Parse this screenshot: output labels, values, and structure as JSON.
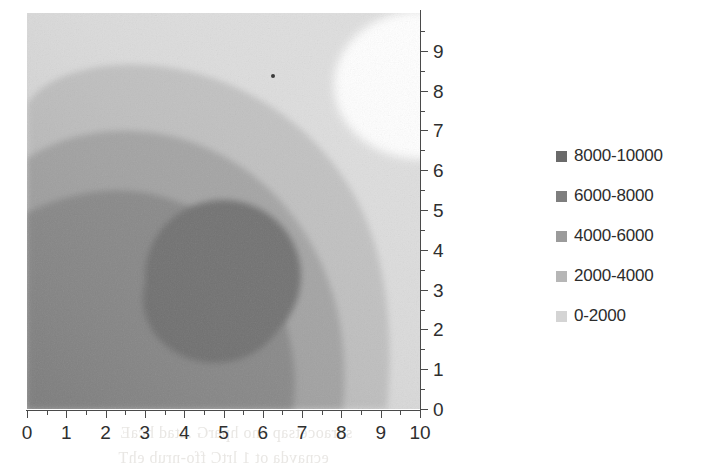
{
  "chart_data": {
    "type": "heatmap",
    "title": "",
    "xlabel": "",
    "ylabel": "",
    "xlim": [
      0,
      10
    ],
    "ylim": [
      0,
      10
    ],
    "grid": false,
    "legend_position": "right",
    "x_ticks": [
      "0",
      "1",
      "2",
      "3",
      "4",
      "5",
      "6",
      "7",
      "8",
      "9",
      "10"
    ],
    "y_ticks": [
      "0",
      "1",
      "2",
      "3",
      "4",
      "5",
      "6",
      "7",
      "8",
      "9"
    ],
    "minor_tick_step": 0.5,
    "colorscale": "grayscale-inverted",
    "value_range": [
      0,
      10000
    ],
    "band_step": 2000,
    "peak": {
      "x": 6.0,
      "y": 3.3,
      "value": 10000
    },
    "minimum": {
      "x": 9.6,
      "y": 8.9,
      "value": 0
    },
    "bands": [
      {
        "label": "8000-10000",
        "min": 8000,
        "max": 10000,
        "color": "#6f6f6f"
      },
      {
        "label": "6000-8000",
        "min": 6000,
        "max": 8000,
        "color": "#8a8a8a"
      },
      {
        "label": "4000-6000",
        "min": 4000,
        "max": 6000,
        "color": "#a5a5a5"
      },
      {
        "label": "2000-4000",
        "min": 2000,
        "max": 4000,
        "color": "#c2c2c2"
      },
      {
        "label": "0-2000",
        "min": 0,
        "max": 2000,
        "color": "#dedede"
      }
    ],
    "series": [
      {
        "name": "8000-10000",
        "values": [
          8000,
          10000
        ]
      },
      {
        "name": "6000-8000",
        "values": [
          6000,
          8000
        ]
      },
      {
        "name": "4000-6000",
        "values": [
          4000,
          6000
        ]
      },
      {
        "name": "2000-4000",
        "values": [
          2000,
          4000
        ]
      },
      {
        "name": "0-2000",
        "values": [
          0,
          2000
        ]
      }
    ]
  },
  "legend": {
    "items": [
      {
        "label": "8000-10000",
        "color": "#6a6a6a"
      },
      {
        "label": "6000-8000",
        "color": "#7e7e7e"
      },
      {
        "label": "4000-6000",
        "color": "#9b9b9b"
      },
      {
        "label": "2000-4000",
        "color": "#b6b6b6"
      },
      {
        "label": "0-2000",
        "color": "#d4d4d4"
      }
    ]
  },
  "axes": {
    "x": {
      "labels": [
        "0",
        "1",
        "2",
        "3",
        "4",
        "5",
        "6",
        "7",
        "8",
        "9",
        "10"
      ]
    },
    "y": {
      "labels": [
        "9",
        "8",
        "7",
        "6",
        "5",
        "4",
        "3",
        "2",
        "1",
        "0"
      ]
    }
  },
  "page_bleed": {
    "line_a": "sdraocetsap eno hparG .atad hcaE",
    "line_b": "ecnavda ot 1 lrtC ffo-nrub ehT",
    "line_c": "",
    "line_d": ""
  }
}
